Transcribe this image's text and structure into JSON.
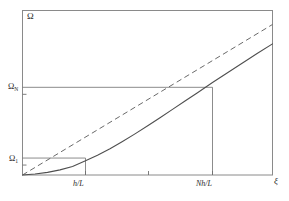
{
  "figure": {
    "name": "omega-vs-xi-dispersion-plot",
    "background_color": "#ffffff",
    "line_color": "#5a5a5a",
    "frame_color": "#8a8a8a"
  },
  "axes": {
    "y_axis_label": "Ω",
    "x_axis_label": "ξ",
    "y_ticks": [
      {
        "label_main": "Ω",
        "label_sub": "N",
        "value": 0.533
      },
      {
        "label_main": "Ω",
        "label_sub": "1",
        "value": 0.103
      }
    ],
    "x_ticks": [
      {
        "label": "h/L",
        "value": 0.252
      },
      {
        "label": "",
        "value": 0.504
      },
      {
        "label": "Nh/L",
        "value": 0.76
      }
    ]
  },
  "chart_data": {
    "type": "line",
    "title": "",
    "xlabel": "ξ",
    "ylabel": "Ω",
    "xlim": [
      0,
      1
    ],
    "ylim": [
      0,
      1
    ],
    "grid": false,
    "legend": "none",
    "annotations": [
      "Horizontal guide line from Ω_1 to curve at ξ = h/L",
      "Horizontal guide line from Ω_N to curve at ξ = Nh/L",
      "Vertical guide line from ξ = h/L up to curve",
      "Vertical guide line from ξ = Nh/L up to curve"
    ],
    "series": [
      {
        "name": "exact-dispersion-curve",
        "style": "solid",
        "x": [
          0.0,
          0.05,
          0.1,
          0.15,
          0.2,
          0.252,
          0.3,
          0.35,
          0.4,
          0.45,
          0.504,
          0.55,
          0.6,
          0.65,
          0.7,
          0.76,
          0.82,
          0.88,
          0.94,
          1.0
        ],
        "y": [
          0.0,
          0.006,
          0.016,
          0.031,
          0.052,
          0.086,
          0.12,
          0.16,
          0.204,
          0.25,
          0.302,
          0.348,
          0.399,
          0.45,
          0.5,
          0.562,
          0.622,
          0.681,
          0.74,
          0.797
        ]
      },
      {
        "name": "linear-asymptote",
        "style": "dashed",
        "x": [
          0.0,
          1.0
        ],
        "y": [
          0.0,
          0.915
        ]
      }
    ]
  }
}
